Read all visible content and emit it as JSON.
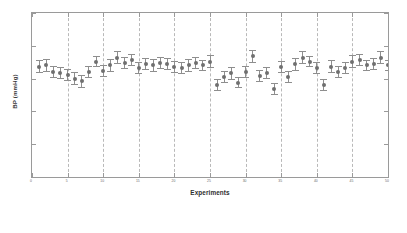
{
  "chart_data": {
    "type": "scatter",
    "title": "",
    "xlabel": "Experiments",
    "ylabel": "BP (mmHg)",
    "xlim": [
      0,
      50
    ],
    "ylim": [
      0,
      250
    ],
    "grid": "vertical dashed group separators only",
    "legend": null,
    "errorbars": true,
    "xticks": [
      0,
      5,
      10,
      15,
      20,
      25,
      30,
      35,
      40,
      45,
      50
    ],
    "xticklabels": [
      "0",
      "5",
      "10",
      "15",
      "20",
      "25",
      "30",
      "35",
      "40",
      "45",
      "50"
    ],
    "yticks": [
      0,
      50,
      100,
      150,
      200,
      250
    ],
    "yticklabels": [
      "0",
      "50",
      "100",
      "150",
      "200",
      "250"
    ],
    "group_separators": [
      5,
      10,
      15,
      20,
      25,
      30,
      35,
      40,
      45
    ],
    "x": [
      1,
      2,
      3,
      4,
      5,
      6,
      7,
      8,
      9,
      10,
      11,
      12,
      13,
      14,
      15,
      16,
      17,
      18,
      19,
      20,
      21,
      22,
      23,
      24,
      25,
      26,
      27,
      28,
      29,
      30,
      31,
      32,
      33,
      34,
      35,
      36,
      37,
      38,
      39,
      40,
      41,
      42,
      43,
      44,
      45,
      46,
      47,
      48,
      49,
      50
    ],
    "values": [
      168,
      170,
      160,
      158,
      156,
      150,
      146,
      160,
      176,
      162,
      170,
      182,
      174,
      178,
      166,
      172,
      170,
      174,
      172,
      168,
      166,
      170,
      174,
      170,
      176,
      140,
      152,
      158,
      144,
      160,
      184,
      154,
      158,
      134,
      168,
      152,
      172,
      182,
      176,
      166,
      140,
      168,
      160,
      166,
      176,
      178,
      170,
      172,
      182,
      170
    ],
    "errors": [
      10,
      10,
      9,
      9,
      9,
      10,
      10,
      9,
      9,
      9,
      10,
      10,
      9,
      9,
      9,
      9,
      10,
      9,
      9,
      9,
      9,
      10,
      9,
      9,
      10,
      9,
      9,
      10,
      9,
      9,
      10,
      9,
      9,
      9,
      9,
      9,
      10,
      10,
      9,
      9,
      9,
      10,
      9,
      9,
      10,
      9,
      9,
      9,
      10,
      9
    ]
  }
}
